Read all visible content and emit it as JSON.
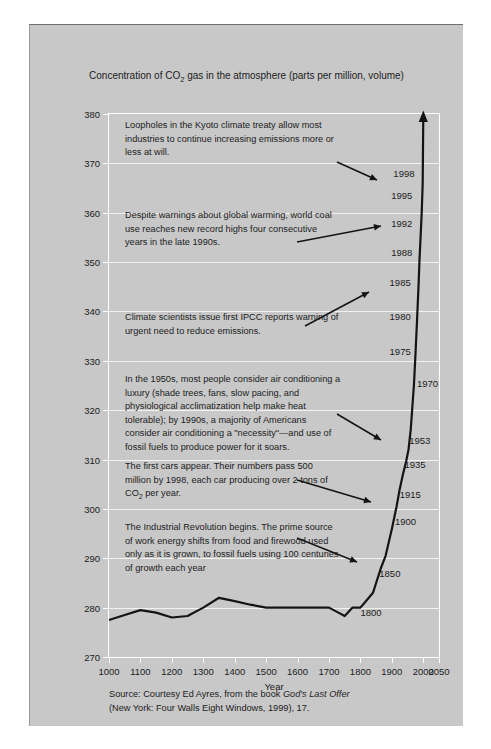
{
  "figure": {
    "subtitle_pre": "Concentration of CO",
    "subtitle_sub": "2",
    "subtitle_post": " gas in the atmosphere (parts per million, volume)",
    "source_line1_pre": "Source: Courtesy Ed Ayres, from the book ",
    "source_line1_italic": "God's Last Offer",
    "source_line2": "(New York: Four Walls  Eight Windows, 1999), 17."
  },
  "chart_data": {
    "type": "line",
    "subtitle": "Concentration of CO2 gas in the atmosphere (parts per million, volume)",
    "xlabel": "Year",
    "ylabel": "",
    "xlim": [
      1000,
      2050
    ],
    "ylim": [
      270,
      380
    ],
    "xticks": [
      1000,
      1100,
      1200,
      1300,
      1400,
      1500,
      1600,
      1700,
      1800,
      1900,
      2000,
      2050
    ],
    "yticks": [
      270,
      280,
      290,
      300,
      310,
      320,
      330,
      340,
      350,
      360,
      370,
      380
    ],
    "grid": "horizontal-white",
    "legend": "none",
    "series": [
      {
        "name": "Atmospheric CO2 concentration",
        "x": [
          1000,
          1050,
          1100,
          1150,
          1200,
          1250,
          1300,
          1350,
          1400,
          1450,
          1500,
          1550,
          1600,
          1650,
          1700,
          1730,
          1750,
          1775,
          1800,
          1820,
          1840,
          1850,
          1865,
          1880,
          1900,
          1915,
          1925,
          1935,
          1945,
          1953,
          1960,
          1970,
          1975,
          1980,
          1985,
          1988,
          1992,
          1995,
          1998,
          2000
        ],
        "values": [
          277.5,
          278.5,
          279.5,
          279.0,
          278.0,
          278.3,
          280.0,
          282.0,
          281.3,
          280.6,
          280.0,
          280.0,
          280.0,
          280.0,
          280.0,
          279.0,
          278.3,
          280.0,
          280.0,
          281.5,
          283.0,
          285.0,
          288.0,
          290.5,
          296.0,
          300.5,
          304.0,
          307.0,
          309.5,
          312.0,
          316.0,
          325.0,
          331.0,
          338.0,
          345.5,
          350.5,
          356.0,
          360.0,
          366.0,
          380.0
        ]
      }
    ],
    "curve_end_arrow": true,
    "curve_labels": [
      {
        "year": "1800",
        "x": 1800,
        "y": 279.2,
        "side": "right"
      },
      {
        "year": "1850",
        "x": 1860,
        "y": 287.0,
        "side": "right"
      },
      {
        "year": "1900",
        "x": 1910,
        "y": 297.5,
        "side": "right"
      },
      {
        "year": "1915",
        "x": 1925,
        "y": 303.0,
        "side": "right"
      },
      {
        "year": "1935",
        "x": 1940,
        "y": 309.0,
        "side": "right"
      },
      {
        "year": "1953",
        "x": 1955,
        "y": 314.0,
        "side": "right"
      },
      {
        "year": "1970",
        "x": 1980,
        "y": 325.5,
        "side": "right"
      },
      {
        "year": "1975",
        "x": 1960,
        "y": 332.0,
        "side": "left"
      },
      {
        "year": "1980",
        "x": 1960,
        "y": 339.0,
        "side": "left"
      },
      {
        "year": "1985",
        "x": 1960,
        "y": 346.0,
        "side": "left"
      },
      {
        "year": "1988",
        "x": 1965,
        "y": 352.0,
        "side": "left"
      },
      {
        "year": "1992",
        "x": 1965,
        "y": 358.0,
        "side": "left"
      },
      {
        "year": "1995",
        "x": 1965,
        "y": 363.5,
        "side": "left"
      },
      {
        "year": "1998",
        "x": 1972,
        "y": 368.0,
        "side": "left"
      }
    ],
    "annotations": [
      {
        "id": "kyoto",
        "text": "Loopholes in the Kyoto climate treaty allow most industries to continue increasing emissions more or less at will.",
        "arrow": true
      },
      {
        "id": "coal",
        "text": "Despite warnings about global warming, world coal use reaches new record highs four consecutive years in the late 1990s.",
        "arrow": true
      },
      {
        "id": "ipcc",
        "text": "Climate scientists issue first IPCC reports warning of urgent need to reduce emissions.",
        "arrow": true
      },
      {
        "id": "airconditioning",
        "text": "In the 1950s, most people consider air conditioning a luxury (shade trees, fans, slow pacing, and physiological acclimatization help make heat tolerable); by 1990s, a majority of Americans consider air conditioning a \"necessity\"—and use of fossil fuels to produce power for it soars.",
        "arrow": true
      },
      {
        "id": "cars",
        "text_pre": "The first cars appear. Their numbers pass 500 million by 1998, each car producing over 2 tons of CO",
        "text_sub": "2",
        "text_post": " per year.",
        "arrow": true
      },
      {
        "id": "industrial",
        "text": "The Industrial Revolution begins. The prime source of work energy shifts from food and firewood used only as it is grown, to fossil fuels using 100 centuries of growth each year",
        "arrow": true
      }
    ]
  },
  "colors": {
    "panel_background": "#c8c8c8",
    "page_background": "#ffffff",
    "grid": "#f2f2f2",
    "curve": "#141414",
    "text": "#1c1c1c"
  }
}
